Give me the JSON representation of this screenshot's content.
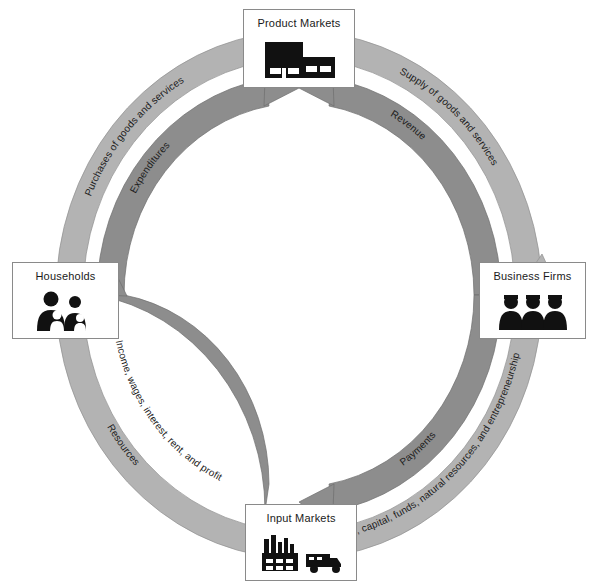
{
  "diagram": {
    "colors": {
      "outer_ring": "#b0b0b0",
      "inner_ring": "#8c8c8c",
      "box_border": "#8a8a8a",
      "background": "#ffffff",
      "icon": "#111111",
      "text": "#1a1a1a"
    },
    "nodes": [
      {
        "id": "product_markets",
        "label": "Product Markets",
        "icon": "factory-storefront-icon"
      },
      {
        "id": "households",
        "label": "Households",
        "icon": "family-icon"
      },
      {
        "id": "business_firms",
        "label": "Business Firms",
        "icon": "business-people-icon"
      },
      {
        "id": "input_markets",
        "label": "Input Markets",
        "icon": "factory-truck-icon"
      }
    ],
    "flows": [
      {
        "id": "purchases",
        "label": "Purchases of goods and services",
        "ring": "outer",
        "quadrant": "top-left",
        "from": "households",
        "to": "product_markets",
        "direction": "clockwise"
      },
      {
        "id": "expenditures",
        "label": "Expenditures",
        "ring": "inner",
        "quadrant": "top-left",
        "from": "households",
        "to": "product_markets",
        "direction": "clockwise"
      },
      {
        "id": "supply",
        "label": "Supply of goods and services",
        "ring": "outer",
        "quadrant": "top-right",
        "from": "product_markets",
        "to": "business_firms",
        "direction": "clockwise"
      },
      {
        "id": "revenue",
        "label": "Revenue",
        "ring": "inner",
        "quadrant": "top-right",
        "from": "business_firms",
        "to": "product_markets",
        "direction": "counterclockwise"
      },
      {
        "id": "resources",
        "label": "Resources",
        "ring": "outer",
        "quadrant": "bottom-left",
        "from": "households",
        "to": "input_markets",
        "direction": "counterclockwise"
      },
      {
        "id": "income",
        "label": "Income, wages, interest, rent, and profit",
        "ring": "inner",
        "quadrant": "bottom-left",
        "from": "input_markets",
        "to": "households",
        "direction": "clockwise"
      },
      {
        "id": "labor",
        "label": "Labor, capital, funds, natural resources, and entrepreneurship",
        "ring": "outer",
        "quadrant": "bottom-right",
        "from": "input_markets",
        "to": "business_firms",
        "direction": "counterclockwise"
      },
      {
        "id": "payments",
        "label": "Payments",
        "ring": "inner",
        "quadrant": "bottom-right",
        "from": "business_firms",
        "to": "input_markets",
        "direction": "clockwise"
      }
    ]
  }
}
